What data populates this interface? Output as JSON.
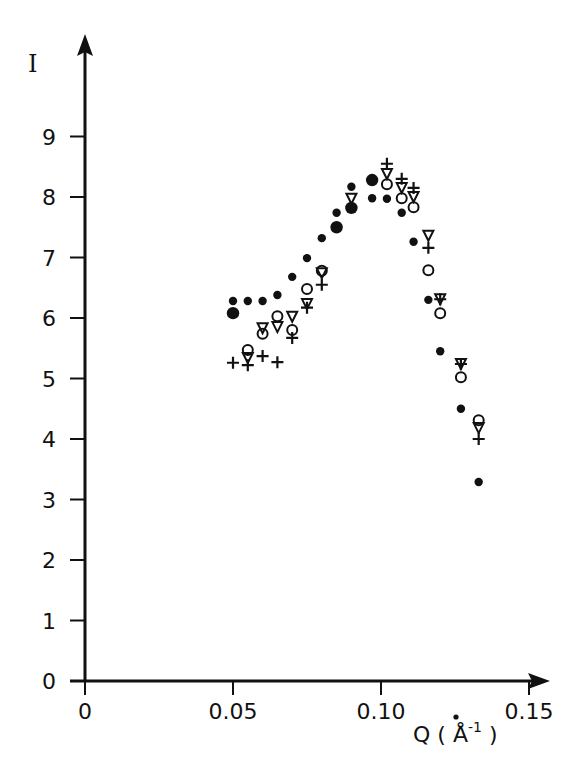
{
  "chart_data": {
    "type": "scatter",
    "title": "",
    "xlabel": "Q (Å⁻¹)",
    "ylabel": "I",
    "xlim": [
      0,
      0.15
    ],
    "ylim": [
      0,
      9
    ],
    "x_ticks": [
      "0",
      "0.05",
      "0.10",
      "0.15"
    ],
    "x_tick_values": [
      0,
      0.05,
      0.1,
      0.15
    ],
    "y_ticks": [
      "0",
      "1",
      "2",
      "3",
      "4",
      "5",
      "6",
      "7",
      "8",
      "9"
    ],
    "y_tick_values": [
      0,
      1,
      2,
      3,
      4,
      5,
      6,
      7,
      8,
      9
    ],
    "grid": false,
    "legend": null,
    "series": [
      {
        "name": "small filled circles",
        "marker": "filled-circle-small",
        "x": [
          0.05,
          0.055,
          0.06,
          0.065,
          0.07,
          0.075,
          0.08,
          0.085,
          0.09,
          0.097,
          0.102,
          0.107,
          0.111,
          0.116,
          0.12,
          0.127,
          0.133
        ],
        "y": [
          6.28,
          6.28,
          6.28,
          6.38,
          6.68,
          6.99,
          7.32,
          7.74,
          8.17,
          7.98,
          7.97,
          7.74,
          7.26,
          6.3,
          5.45,
          4.5,
          3.29
        ]
      },
      {
        "name": "large filled circles",
        "marker": "filled-circle-large",
        "x": [
          0.05,
          0.085,
          0.09,
          0.097
        ],
        "y": [
          6.08,
          7.5,
          7.82,
          8.28
        ]
      },
      {
        "name": "open circles",
        "marker": "open-circle",
        "x": [
          0.055,
          0.06,
          0.065,
          0.07,
          0.075,
          0.08,
          0.102,
          0.107,
          0.111,
          0.116,
          0.12,
          0.127,
          0.133
        ],
        "y": [
          5.47,
          5.74,
          6.03,
          5.8,
          6.48,
          6.78,
          8.21,
          7.98,
          7.83,
          6.79,
          6.08,
          5.02,
          4.31
        ]
      },
      {
        "name": "open triangles",
        "marker": "open-triangle-down",
        "x": [
          0.055,
          0.06,
          0.065,
          0.07,
          0.075,
          0.08,
          0.09,
          0.102,
          0.107,
          0.111,
          0.116,
          0.12,
          0.127,
          0.133
        ],
        "y": [
          5.34,
          5.83,
          5.85,
          6.02,
          6.23,
          6.74,
          7.97,
          8.38,
          8.15,
          8.0,
          7.36,
          6.31,
          5.24,
          4.18
        ]
      },
      {
        "name": "crosses",
        "marker": "plus",
        "x": [
          0.05,
          0.055,
          0.06,
          0.065,
          0.07,
          0.075,
          0.08,
          0.102,
          0.107,
          0.111,
          0.116,
          0.12,
          0.127,
          0.133
        ],
        "y": [
          5.26,
          5.22,
          5.37,
          5.27,
          5.67,
          6.17,
          6.55,
          8.55,
          8.3,
          8.15,
          7.16,
          6.31,
          5.24,
          4.0
        ]
      }
    ]
  },
  "axes": {
    "y_title": "I",
    "x_title_main": "Q ( Å",
    "x_title_sup": "-1",
    "x_title_close": " )"
  },
  "colors": {
    "ink": "#111111",
    "background": "#ffffff"
  }
}
